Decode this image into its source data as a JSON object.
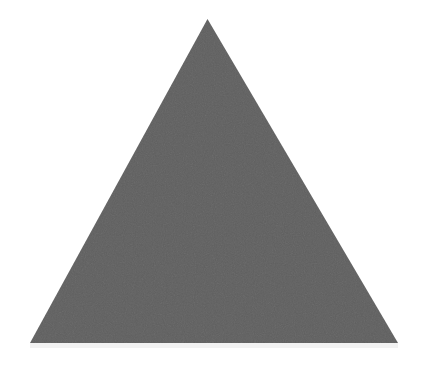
{
  "image": {
    "width": 433,
    "height": 367,
    "background_color": "#ffffff",
    "alt": "solid gray triangle"
  },
  "shape": {
    "name": "triangle",
    "kind": "polygon",
    "sides": 3,
    "orientation": "apex-up",
    "fill_color": "#616161",
    "stroke_color": "none",
    "stroke_width": 0,
    "has_texture": true,
    "texture": "fine canvas grain",
    "vertices": [
      {
        "label": "apex",
        "x": 207.5,
        "y": 19
      },
      {
        "label": "bottom-left",
        "x": 30,
        "y": 343
      },
      {
        "label": "bottom-right",
        "x": 398,
        "y": 343
      }
    ],
    "points_attr": "207.5,19 398,343 30,343",
    "base_width": 368,
    "height": 324,
    "centroid": {
      "x": 211.8,
      "y": 235
    }
  },
  "shadow": {
    "name": "base-shadow",
    "color": "#f2f2f2",
    "x": 30,
    "y": 343,
    "width": 368,
    "height": 5
  }
}
